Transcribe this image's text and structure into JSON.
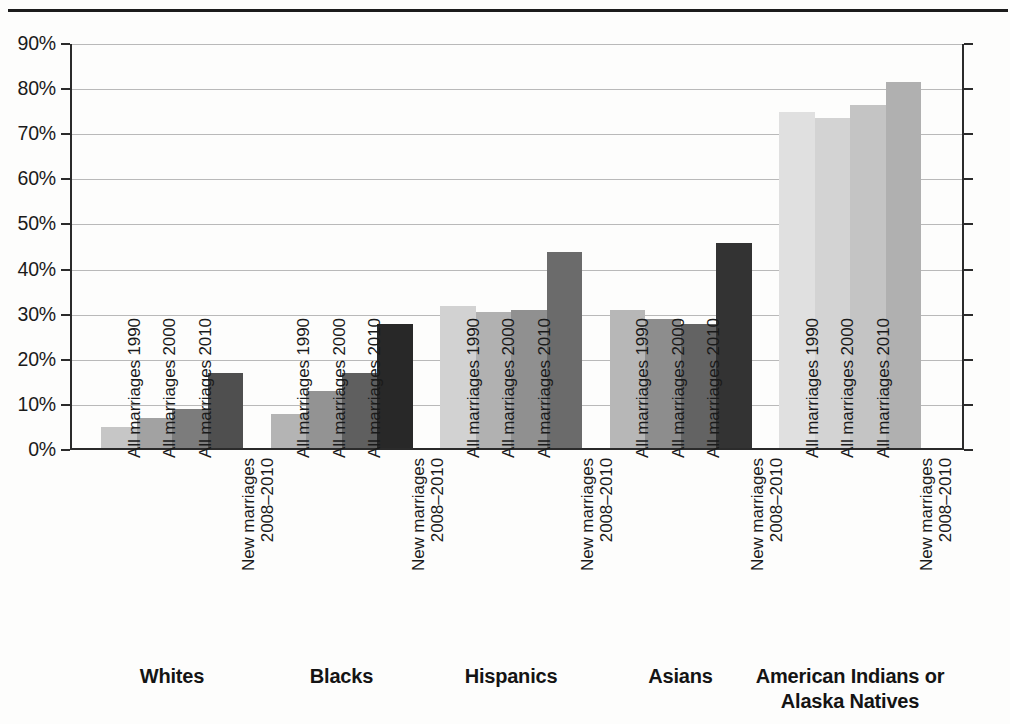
{
  "chart_data": {
    "type": "bar",
    "title": "",
    "subtitle": "",
    "xlabel": "",
    "ylabel": "",
    "ylim": [
      0,
      90
    ],
    "grid": true,
    "legend_position": "none",
    "y_tick_labels": [
      "90%",
      "80%",
      "70%",
      "60%",
      "50%",
      "40%",
      "30%",
      "20%",
      "10%",
      "0%"
    ],
    "y_tick_values": [
      90,
      80,
      70,
      60,
      50,
      40,
      30,
      20,
      10,
      0
    ],
    "categories": [
      "All marriages 1990",
      "All marriages 2000",
      "All marriages 2010",
      "New marriages 2008–2010"
    ],
    "category_label_lines": [
      [
        "All marriages 1990",
        ""
      ],
      [
        "All marriages 2000",
        ""
      ],
      [
        "All marriages 2010",
        ""
      ],
      [
        "New marriages",
        "2008–2010"
      ]
    ],
    "groups": [
      {
        "name": "Whites",
        "name_lines": [
          "Whites"
        ],
        "values": [
          5,
          7,
          9,
          17
        ],
        "colors": [
          "#c6c6c6",
          "#a2a2a2",
          "#7c7c7c",
          "#4f4f4f"
        ]
      },
      {
        "name": "Blacks",
        "name_lines": [
          "Blacks"
        ],
        "values": [
          8,
          13,
          17,
          28
        ],
        "colors": [
          "#b4b4b4",
          "#939393",
          "#5f5f5f",
          "#282828"
        ]
      },
      {
        "name": "Hispanics",
        "name_lines": [
          "Hispanics"
        ],
        "values": [
          32,
          30.5,
          31,
          44
        ],
        "colors": [
          "#d2d2d2",
          "#b1b1b1",
          "#909090",
          "#6b6b6b"
        ]
      },
      {
        "name": "Asians",
        "name_lines": [
          "Asians"
        ],
        "values": [
          31,
          29,
          28,
          46
        ],
        "colors": [
          "#b7b7b7",
          "#8d8d8d",
          "#636363",
          "#333333"
        ]
      },
      {
        "name": "American Indians or Alaska Natives",
        "name_lines": [
          "American Indians or",
          "Alaska Natives"
        ],
        "values": [
          75,
          73.5,
          76.5,
          81.5
        ],
        "colors": [
          "#e0e0e0",
          "#d3d3d3",
          "#c4c4c4",
          "#b0b0b0"
        ]
      }
    ]
  }
}
